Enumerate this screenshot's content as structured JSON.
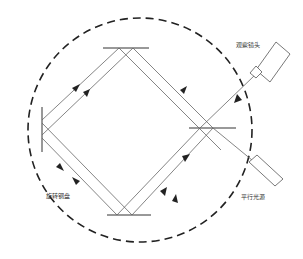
{
  "diagram": {
    "labels": {
      "observation_lens": "观察镜头",
      "parallel_light": "平行光源",
      "rotating_mirror": "旋转钢盘"
    },
    "colors": {
      "line": "#555555",
      "arrow": "#222222",
      "dashed_circle": "#222222",
      "beam_splitter": "#888888"
    }
  }
}
